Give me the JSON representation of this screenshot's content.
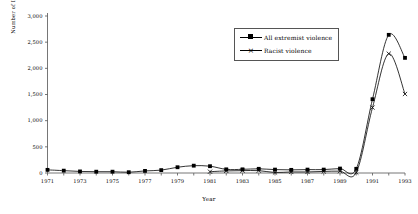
{
  "chart_data": {
    "type": "line",
    "title": "",
    "xlabel": "Year",
    "ylabel": "Number of Incidents",
    "x": [
      1971,
      1972,
      1973,
      1974,
      1975,
      1976,
      1977,
      1978,
      1979,
      1980,
      1981,
      1982,
      1983,
      1984,
      1985,
      1986,
      1987,
      1988,
      1989,
      1990,
      1991,
      1992,
      1993
    ],
    "xlim": [
      1971,
      1993
    ],
    "ylim": [
      0,
      3000
    ],
    "yticks": [
      0,
      500,
      1000,
      1500,
      2000,
      2500,
      3000
    ],
    "ytick_labels": [
      "0",
      "500",
      "1,000",
      "1,500",
      "2,000",
      "2,500",
      "3,000"
    ],
    "xtick_labels": [
      "1971",
      "1973",
      "1975",
      "1977",
      "1979",
      "1981",
      "1983",
      "1985",
      "1987",
      "1989",
      "1991",
      "1993"
    ],
    "grid": false,
    "legend_position": "upper-right",
    "series": [
      {
        "name": "All extremist violence",
        "marker": "filled-square",
        "values": [
          60,
          45,
          30,
          25,
          25,
          15,
          40,
          55,
          110,
          140,
          130,
          70,
          70,
          80,
          65,
          60,
          65,
          65,
          85,
          80,
          1410,
          2640,
          2200
        ]
      },
      {
        "name": "Racist violence",
        "marker": "cross-x",
        "values": [
          null,
          null,
          null,
          null,
          null,
          null,
          null,
          null,
          null,
          null,
          25,
          40,
          45,
          45,
          10,
          20,
          20,
          30,
          35,
          10,
          1250,
          2280,
          1510
        ]
      }
    ]
  },
  "legend": {
    "entries": [
      {
        "label": "All extremist violence",
        "marker": "filled-square-marker"
      },
      {
        "label": "Racist violence",
        "marker": "cross-x-marker"
      }
    ]
  },
  "axes": {
    "y_title": "Number of Incidents",
    "x_title": "Year"
  }
}
